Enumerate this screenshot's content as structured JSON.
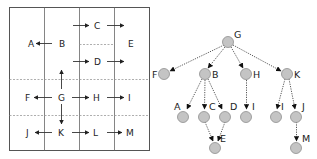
{
  "grid": {
    "cells": [
      {
        "id": "A",
        "label": "A"
      },
      {
        "id": "B",
        "label": "B"
      },
      {
        "id": "C",
        "label": "C"
      },
      {
        "id": "D",
        "label": "D"
      },
      {
        "id": "E",
        "label": "E"
      },
      {
        "id": "F",
        "label": "F"
      },
      {
        "id": "G",
        "label": "G"
      },
      {
        "id": "H",
        "label": "H"
      },
      {
        "id": "I",
        "label": "I"
      },
      {
        "id": "J",
        "label": "J"
      },
      {
        "id": "K",
        "label": "K"
      },
      {
        "id": "L",
        "label": "L"
      },
      {
        "id": "M",
        "label": "M"
      }
    ],
    "arrows": [
      [
        "B",
        "A"
      ],
      [
        "B",
        "C"
      ],
      [
        "C",
        "E"
      ],
      [
        "B",
        "D"
      ],
      [
        "D",
        "E"
      ],
      [
        "G",
        "B"
      ],
      [
        "G",
        "F"
      ],
      [
        "G",
        "H"
      ],
      [
        "H",
        "I"
      ],
      [
        "G",
        "K"
      ],
      [
        "K",
        "J"
      ],
      [
        "K",
        "L"
      ],
      [
        "L",
        "M"
      ]
    ]
  },
  "tree": {
    "root": "G",
    "nodes": [
      {
        "id": "G",
        "label": "G"
      },
      {
        "id": "F",
        "label": "F"
      },
      {
        "id": "B",
        "label": "B"
      },
      {
        "id": "H",
        "label": "H"
      },
      {
        "id": "K",
        "label": "K"
      },
      {
        "id": "A",
        "label": "A"
      },
      {
        "id": "C",
        "label": "C"
      },
      {
        "id": "D",
        "label": "D"
      },
      {
        "id": "I1",
        "label": "I"
      },
      {
        "id": "I2",
        "label": "I"
      },
      {
        "id": "J",
        "label": "J"
      },
      {
        "id": "E",
        "label": "E"
      },
      {
        "id": "M",
        "label": "M"
      }
    ],
    "edges": [
      [
        "G",
        "F"
      ],
      [
        "G",
        "B"
      ],
      [
        "G",
        "H"
      ],
      [
        "G",
        "K"
      ],
      [
        "B",
        "A"
      ],
      [
        "B",
        "C"
      ],
      [
        "B",
        "D"
      ],
      [
        "H",
        "I1"
      ],
      [
        "K",
        "I2"
      ],
      [
        "K",
        "J"
      ],
      [
        "C",
        "E"
      ],
      [
        "D",
        "E"
      ],
      [
        "J",
        "M"
      ]
    ]
  },
  "colors": {
    "grid_line": "#555555",
    "dashed_line": "#9a9a9a",
    "node_fill": "#c4c4c4",
    "node_stroke": "#8e8e8e",
    "edge": "#555555",
    "text": "#222222"
  }
}
